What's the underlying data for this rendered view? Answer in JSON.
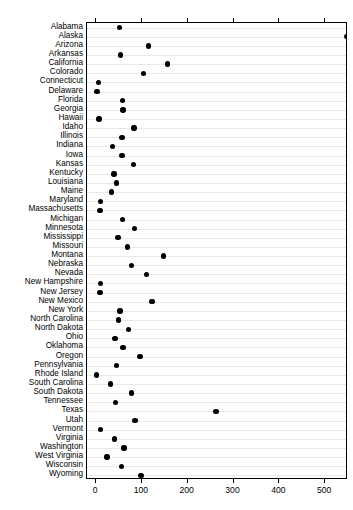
{
  "chart_data": {
    "type": "scatter",
    "subtype": "cleveland-dot-plot",
    "title": "",
    "subtitle": "",
    "xlabel": "",
    "ylabel": "",
    "xlim": [
      -20,
      550
    ],
    "xticks": [
      0,
      100,
      200,
      300,
      400,
      500
    ],
    "xticklabels": [
      "0",
      "100",
      "200",
      "300",
      "400",
      "500"
    ],
    "grid": true,
    "grid_orientation": "horizontal",
    "legend": false,
    "legend_position": "none",
    "marker": "filled-circle",
    "marker_color": "#000000",
    "categories": [
      "Alabama",
      "Alaska",
      "Arizona",
      "Arkansas",
      "California",
      "Colorado",
      "Connecticut",
      "Delaware",
      "Florida",
      "Georgia",
      "Hawaii",
      "Idaho",
      "Illinois",
      "Indiana",
      "Iowa",
      "Kansas",
      "Kentucky",
      "Louisiana",
      "Maine",
      "Maryland",
      "Massachusetts",
      "Michigan",
      "Minnesota",
      "Mississippi",
      "Missouri",
      "Montana",
      "Nebraska",
      "Nevada",
      "New Hampshire",
      "New Jersey",
      "New Mexico",
      "New York",
      "North Carolina",
      "North Dakota",
      "Ohio",
      "Oklahoma",
      "Oregon",
      "Pennsylvania",
      "Rhode Island",
      "South Carolina",
      "South Dakota",
      "Tennessee",
      "Texas",
      "Utah",
      "Vermont",
      "Virginia",
      "Washington",
      "West Virginia",
      "Wisconsin",
      "Wyoming"
    ],
    "values": [
      51,
      547,
      114,
      53,
      156,
      104,
      5,
      2,
      58,
      59,
      6,
      83,
      56,
      36,
      56,
      82,
      39,
      45,
      33,
      10,
      8,
      57,
      84,
      48,
      69,
      147,
      77,
      110,
      9,
      8,
      122,
      52,
      49,
      70,
      41,
      59,
      96,
      45,
      1,
      31,
      77,
      42,
      262,
      85,
      9,
      40,
      61,
      24,
      55,
      98
    ],
    "n_points": 50
  },
  "axis": {
    "x_tick_labels": [
      "0",
      "100",
      "200",
      "300",
      "400",
      "500"
    ]
  }
}
